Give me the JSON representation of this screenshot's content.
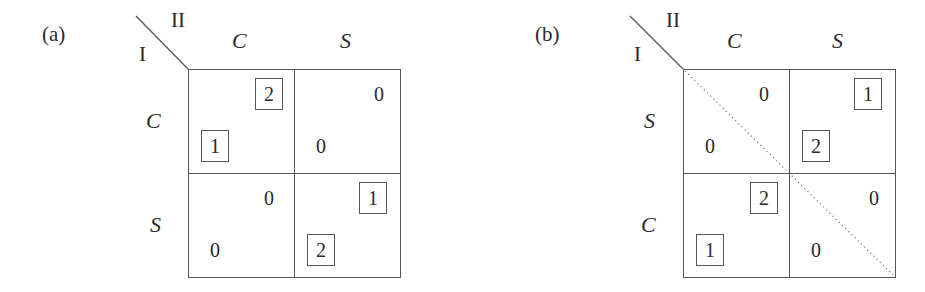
{
  "panels": [
    {
      "id": "a",
      "label": "(a)",
      "row_player": "I",
      "col_player": "II",
      "col_strategies": [
        "C",
        "S"
      ],
      "row_strategies": [
        "C",
        "S"
      ],
      "dotted_diagonal": false,
      "cells": [
        [
          {
            "row": "1",
            "row_boxed": true,
            "col": "2",
            "col_boxed": true
          },
          {
            "row": "0",
            "row_boxed": false,
            "col": "0",
            "col_boxed": false
          }
        ],
        [
          {
            "row": "0",
            "row_boxed": false,
            "col": "0",
            "col_boxed": false
          },
          {
            "row": "2",
            "row_boxed": true,
            "col": "1",
            "col_boxed": true
          }
        ]
      ]
    },
    {
      "id": "b",
      "label": "(b)",
      "row_player": "I",
      "col_player": "II",
      "col_strategies": [
        "C",
        "S"
      ],
      "row_strategies": [
        "S",
        "C"
      ],
      "dotted_diagonal": true,
      "cells": [
        [
          {
            "row": "0",
            "row_boxed": false,
            "col": "0",
            "col_boxed": false
          },
          {
            "row": "2",
            "row_boxed": true,
            "col": "1",
            "col_boxed": true
          }
        ],
        [
          {
            "row": "1",
            "row_boxed": true,
            "col": "2",
            "col_boxed": true
          },
          {
            "row": "0",
            "row_boxed": false,
            "col": "0",
            "col_boxed": false
          }
        ]
      ]
    }
  ],
  "colors": {
    "ink": "#2a2a2a",
    "lines": "#555555",
    "background": "#ffffff"
  }
}
